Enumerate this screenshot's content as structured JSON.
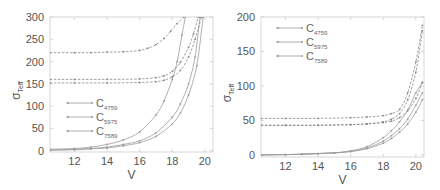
{
  "chart_data": [
    {
      "type": "line",
      "panel": "left",
      "title": "",
      "xlabel": "V",
      "ylabel": "σ_Teff",
      "ylabel_main": "σ",
      "ylabel_sub": "Teff",
      "xlim": [
        10.5,
        20.5
      ],
      "ylim": [
        -3,
        300
      ],
      "xticks": [
        12,
        14,
        16,
        18,
        20
      ],
      "yticks": [
        0,
        50,
        100,
        150,
        200,
        250,
        300
      ],
      "grid": false,
      "legend_position": "center-left",
      "legend": [
        {
          "main": "C",
          "sub": "4759"
        },
        {
          "main": "C",
          "sub": "5975"
        },
        {
          "main": "C",
          "sub": "7589"
        }
      ],
      "series": [
        {
          "name": "C4759 (solid)",
          "style": "solid",
          "x": [
            10.5,
            12,
            13,
            14,
            15,
            16,
            17,
            17.5,
            18,
            18.3,
            18.6,
            18.8
          ],
          "values": [
            3,
            5,
            8,
            14,
            24,
            42,
            80,
            112,
            160,
            200,
            260,
            300
          ]
        },
        {
          "name": "C5975 (solid)",
          "style": "solid",
          "x": [
            10.5,
            12,
            13,
            14,
            15,
            16,
            17,
            18,
            18.5,
            19,
            19.4,
            19.7
          ],
          "values": [
            2,
            3,
            5,
            8,
            14,
            22,
            40,
            75,
            105,
            150,
            210,
            300
          ]
        },
        {
          "name": "C7589 (solid)",
          "style": "solid",
          "x": [
            10.5,
            12,
            13,
            14,
            15,
            16,
            17,
            18,
            18.5,
            19,
            19.5,
            19.9
          ],
          "values": [
            1,
            2,
            4,
            6,
            11,
            18,
            32,
            60,
            85,
            125,
            190,
            300
          ]
        },
        {
          "name": "C4759 (dashed)",
          "style": "dashed",
          "x": [
            10.5,
            12,
            13,
            14,
            15,
            16,
            16.5,
            17,
            17.5,
            17.9,
            18.3,
            18.7
          ],
          "values": [
            220,
            220,
            220,
            221,
            222,
            225,
            230,
            238,
            252,
            268,
            285,
            300
          ]
        },
        {
          "name": "C5975 (dashed)",
          "style": "dashed",
          "x": [
            10.5,
            12,
            14,
            16,
            17,
            17.5,
            18,
            18.5,
            19,
            19.3,
            19.6
          ],
          "values": [
            160,
            160,
            160,
            161,
            164,
            168,
            178,
            198,
            232,
            262,
            300
          ]
        },
        {
          "name": "C7589 (dashed)",
          "style": "dashed",
          "x": [
            10.5,
            12,
            14,
            16,
            17,
            17.5,
            18,
            18.5,
            19,
            19.4,
            19.8
          ],
          "values": [
            152,
            152,
            152,
            153,
            155,
            158,
            166,
            180,
            210,
            250,
            300
          ]
        }
      ]
    },
    {
      "type": "line",
      "panel": "right",
      "title": "",
      "xlabel": "V",
      "ylabel": "σ_Teff",
      "ylabel_main": "σ",
      "ylabel_sub": "Teff",
      "xlim": [
        10.5,
        20.5
      ],
      "ylim": [
        -3,
        200
      ],
      "xticks": [
        12,
        14,
        16,
        18,
        20
      ],
      "yticks": [
        0,
        50,
        100,
        150,
        200
      ],
      "grid": false,
      "legend_position": "upper-left",
      "legend": [
        {
          "main": "C",
          "sub": "4759"
        },
        {
          "main": "C",
          "sub": "5975"
        },
        {
          "main": "C",
          "sub": "7589"
        }
      ],
      "series": [
        {
          "name": "C4759 (solid)",
          "style": "solid",
          "x": [
            10.5,
            12,
            13,
            14,
            15,
            16,
            17,
            18,
            18.5,
            19,
            19.5,
            20,
            20.4
          ],
          "values": [
            0,
            0.5,
            1,
            2,
            3,
            6,
            12,
            25,
            35,
            48,
            65,
            90,
            105
          ]
        },
        {
          "name": "C5975 (solid)",
          "style": "solid",
          "x": [
            10.5,
            12,
            13,
            14,
            15,
            16,
            17,
            18,
            18.5,
            19,
            19.5,
            20,
            20.4
          ],
          "values": [
            0,
            0.5,
            1,
            2,
            3,
            5,
            10,
            20,
            28,
            38,
            52,
            72,
            90
          ]
        },
        {
          "name": "C7589 (solid)",
          "style": "solid",
          "x": [
            10.5,
            12,
            13,
            14,
            15,
            16,
            17,
            18,
            18.5,
            19,
            19.5,
            20,
            20.4
          ],
          "values": [
            0,
            0.5,
            1,
            2,
            3,
            5,
            9,
            17,
            24,
            33,
            45,
            62,
            80
          ]
        },
        {
          "name": "C4759 (dashed)",
          "style": "dashed",
          "x": [
            10.5,
            12,
            14,
            16,
            17,
            18,
            18.5,
            19,
            19.5,
            20,
            20.4
          ],
          "values": [
            53,
            53,
            53,
            54,
            55,
            57,
            60,
            66,
            90,
            135,
            188
          ]
        },
        {
          "name": "C5975 (dashed)",
          "style": "dashed",
          "x": [
            10.5,
            12,
            14,
            16,
            17,
            18,
            18.5,
            19,
            19.5,
            20,
            20.4
          ],
          "values": [
            43,
            43,
            43,
            44,
            45,
            48,
            52,
            60,
            80,
            120,
            180
          ]
        },
        {
          "name": "C7589 (dashed)",
          "style": "dashed",
          "x": [
            10.5,
            12,
            14,
            16,
            17,
            18,
            18.5,
            19,
            19.5,
            20,
            20.4
          ],
          "values": [
            43,
            43,
            43,
            44,
            45,
            47,
            49,
            54,
            64,
            82,
            105
          ]
        }
      ]
    }
  ],
  "colors": {
    "axis": "#cccccc",
    "tick_text": "#555555",
    "line": "#9a9a9a",
    "dashed_line": "#888888"
  }
}
